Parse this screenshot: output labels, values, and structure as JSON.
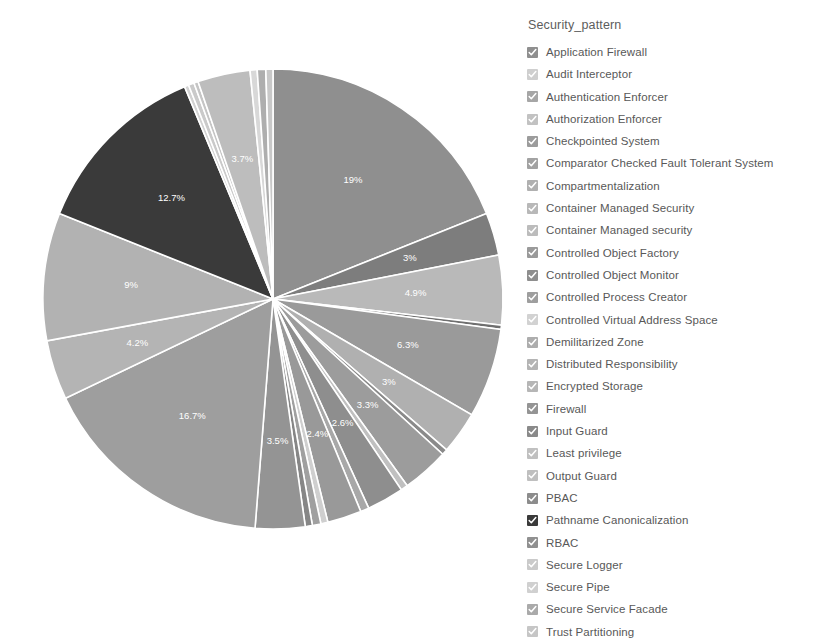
{
  "legend": {
    "title": "Security_pattern"
  },
  "chart_data": {
    "type": "pie",
    "title": "",
    "legend_title": "Security_pattern",
    "legend_position": "right",
    "start_angle_deg": 0,
    "direction": "clockwise",
    "label_format": "percent",
    "units": "percent",
    "categories": [
      "Application Firewall",
      "Audit Interceptor",
      "Authentication Enforcer",
      "Authorization Enforcer",
      "Checkpointed System",
      "Comparator Checked Fault Tolerant System",
      "Compartmentalization",
      "Container Managed Security",
      "Container Managed security",
      "Controlled Object Factory",
      "Controlled Object Monitor",
      "Controlled Process Creator",
      "Controlled Virtual Address Space",
      "Demilitarized Zone",
      "Distributed Responsibility",
      "Encrypted Storage",
      "Firewall",
      "Input Guard",
      "Least privilege",
      "Output Guard",
      "PBAC",
      "Pathname Canonicalization",
      "RBAC",
      "Secure Logger",
      "Secure Pipe",
      "Secure Service Facade",
      "Trust Partitioning"
    ],
    "values": [
      19,
      3,
      4.9,
      0.3,
      6.3,
      3,
      0.4,
      3.3,
      0.5,
      2.6,
      0.6,
      2.4,
      0.5,
      0.6,
      0.5,
      3.5,
      16.7,
      4.2,
      9,
      12.7,
      0.3,
      0.4,
      0.3,
      3.7,
      0.5,
      0.6,
      0.5
    ],
    "labels": [
      "19%",
      "3%",
      "4.9%",
      "",
      "6.3%",
      "3%",
      "",
      "3.3%",
      "",
      "2.6%",
      "",
      "2.4%",
      "",
      "",
      "",
      "3.5%",
      "16.7%",
      "4.2%",
      "9%",
      "12.7%",
      "",
      "",
      "",
      "3.7%",
      "",
      "",
      ""
    ],
    "colors": [
      "#8f8f8f",
      "#7d7d7d",
      "#b9b9b9",
      "#6f6f6f",
      "#9a9a9a",
      "#b0b0b0",
      "#8a8a8a",
      "#9c9c9c",
      "#c0c0c0",
      "#8e8e8e",
      "#a8a8a8",
      "#999999",
      "#cfcfcf",
      "#a0a0a0",
      "#868686",
      "#949494",
      "#9e9e9e",
      "#b4b4b4",
      "#b2b2b2",
      "#3a3a3a",
      "#d2d2d2",
      "#cacaca",
      "#c5c5c5",
      "#bdbdbd",
      "#d8d8d8",
      "#aeaeae",
      "#c8c8c8"
    ],
    "legend_items": [
      {
        "label": "Application Firewall",
        "swatch": "#8f8f8f"
      },
      {
        "label": "Audit Interceptor",
        "swatch": "#cfcfcf"
      },
      {
        "label": "Authentication Enforcer",
        "swatch": "#a6a6a6"
      },
      {
        "label": "Authorization Enforcer",
        "swatch": "#c2c2c2"
      },
      {
        "label": "Checkpointed System",
        "swatch": "#9c9c9c"
      },
      {
        "label": "Comparator Checked Fault Tolerant System",
        "swatch": "#a2a2a2"
      },
      {
        "label": "Compartmentalization",
        "swatch": "#b0b0b0"
      },
      {
        "label": "Container Managed Security",
        "swatch": "#b8b8b8"
      },
      {
        "label": "Container Managed security",
        "swatch": "#bcbcbc"
      },
      {
        "label": "Controlled Object Factory",
        "swatch": "#9a9a9a"
      },
      {
        "label": "Controlled Object Monitor",
        "swatch": "#8e8e8e"
      },
      {
        "label": "Controlled Process Creator",
        "swatch": "#9e9e9e"
      },
      {
        "label": "Controlled Virtual Address Space",
        "swatch": "#d2d2d2"
      },
      {
        "label": "Demilitarized Zone",
        "swatch": "#adadad"
      },
      {
        "label": "Distributed Responsibility",
        "swatch": "#b4b4b4"
      },
      {
        "label": "Encrypted Storage",
        "swatch": "#b6b6b6"
      },
      {
        "label": "Firewall",
        "swatch": "#949494"
      },
      {
        "label": "Input Guard",
        "swatch": "#8a8a8a"
      },
      {
        "label": "Least privilege",
        "swatch": "#c0c0c0"
      },
      {
        "label": "Output Guard",
        "swatch": "#bfbfbf"
      },
      {
        "label": "PBAC",
        "swatch": "#8c8c8c"
      },
      {
        "label": "Pathname Canonicalization",
        "swatch": "#3a3a3a"
      },
      {
        "label": "RBAC",
        "swatch": "#909090"
      },
      {
        "label": "Secure Logger",
        "swatch": "#cacaca"
      },
      {
        "label": "Secure Pipe",
        "swatch": "#d0d0d0"
      },
      {
        "label": "Secure Service Facade",
        "swatch": "#aaaaaa"
      },
      {
        "label": "Trust Partitioning",
        "swatch": "#c6c6c6"
      }
    ],
    "geometry": {
      "cx": 273,
      "cy": 299,
      "r": 230,
      "label_radius_factor": 0.62
    }
  }
}
